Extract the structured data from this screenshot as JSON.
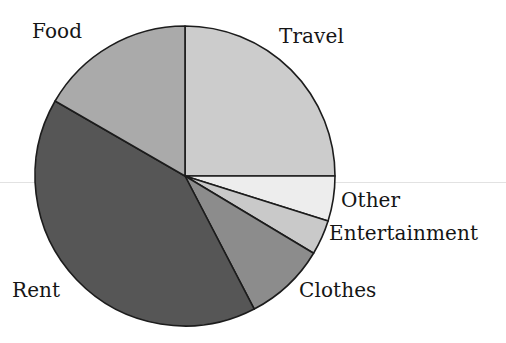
{
  "page": {
    "background_color": "#ffffff",
    "width": 506,
    "height": 343
  },
  "chart_data": {
    "type": "pie",
    "title": "",
    "subtitle": "",
    "xlabel": "",
    "ylabel": "",
    "legend_position": "none",
    "labels_position": "outside",
    "grid": false,
    "center": {
      "x": 185,
      "y": 176
    },
    "radius": 150,
    "start_angle_deg": -90,
    "direction": "clockwise",
    "outline_color": "#1c1c1c",
    "categories": [
      "Travel",
      "Other",
      "Entertainment",
      "Clothes",
      "Rent",
      "Food"
    ],
    "values": [
      25.0,
      4.9,
      3.7,
      8.7,
      41.0,
      16.7
    ],
    "slices": [
      {
        "label": "Travel",
        "value": 25.0,
        "start_deg": -90.0,
        "end_deg": 0.0,
        "sweep_deg": 90.0,
        "color": "#cccccc"
      },
      {
        "label": "Other",
        "value": 4.9,
        "start_deg": 0.0,
        "end_deg": 17.5,
        "sweep_deg": 17.5,
        "color": "#ededed"
      },
      {
        "label": "Entertainment",
        "value": 3.7,
        "start_deg": 17.5,
        "end_deg": 31.0,
        "sweep_deg": 13.5,
        "color": "#c9c9c9"
      },
      {
        "label": "Clothes",
        "value": 8.7,
        "start_deg": 31.0,
        "end_deg": 62.5,
        "sweep_deg": 31.5,
        "color": "#8c8c8c"
      },
      {
        "label": "Rent",
        "value": 41.0,
        "start_deg": 62.5,
        "end_deg": 210.0,
        "sweep_deg": 147.5,
        "color": "#565656"
      },
      {
        "label": "Food",
        "value": 16.7,
        "start_deg": 210.0,
        "end_deg": 270.0,
        "sweep_deg": 60.0,
        "color": "#aaaaaa"
      }
    ]
  },
  "labels": {
    "food": "Food",
    "travel": "Travel",
    "other": "Other",
    "entertainment": "Entertainment",
    "clothes": "Clothes",
    "rent": "Rent"
  }
}
